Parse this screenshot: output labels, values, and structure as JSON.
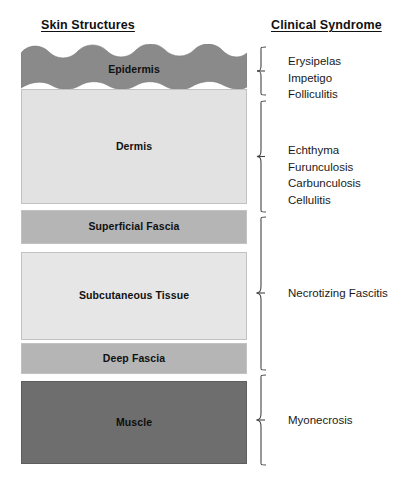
{
  "figure": {
    "columns": {
      "left_header": "Skin Structures",
      "right_header": "Clinical Syndrome"
    },
    "colors": {
      "epidermis_fill": "#8a8a8a",
      "dermis_fill": "#e2e2e2",
      "superficial_fascia_fill": "#b5b5b5",
      "subcutaneous_fill": "#e6e6e6",
      "deep_fascia_fill": "#b5b5b5",
      "muscle_fill": "#6e6e6e",
      "border": "#c2c2c2",
      "text": "#1a1a1a",
      "bracket": "#444444",
      "background": "#ffffff"
    },
    "layers": [
      {
        "id": "epidermis",
        "label": "Epidermis",
        "tone": "dark"
      },
      {
        "id": "dermis",
        "label": "Dermis",
        "tone": "light"
      },
      {
        "id": "superficial-fascia",
        "label": "Superficial Fascia",
        "tone": "mid"
      },
      {
        "id": "subcutaneous-tissue",
        "label": "Subcutaneous Tissue",
        "tone": "light"
      },
      {
        "id": "deep-fascia",
        "label": "Deep Fascia",
        "tone": "mid"
      },
      {
        "id": "muscle",
        "label": "Muscle",
        "tone": "dark"
      }
    ],
    "syndrome_groups": [
      {
        "id": "group-epidermis",
        "spans": [
          "epidermis"
        ],
        "items": [
          "Erysipelas",
          "Impetigo",
          "Folliculitis"
        ]
      },
      {
        "id": "group-dermis",
        "spans": [
          "dermis",
          "superficial-fascia"
        ],
        "items": [
          "Echthyma",
          "Furunculosis",
          "Carbunculosis",
          "Cellulitis"
        ]
      },
      {
        "id": "group-fascia",
        "spans": [
          "superficial-fascia",
          "subcutaneous-tissue",
          "deep-fascia"
        ],
        "items": [
          "Necrotizing Fascitis"
        ]
      },
      {
        "id": "group-muscle",
        "spans": [
          "muscle"
        ],
        "items": [
          "Myonecrosis"
        ]
      }
    ]
  }
}
